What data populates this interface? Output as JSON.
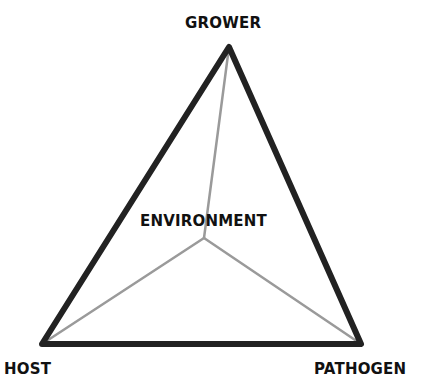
{
  "diagram": {
    "vertices": {
      "top": {
        "label": "GROWER",
        "x": 229,
        "y": 47
      },
      "left": {
        "label": "HOST",
        "x": 42,
        "y": 344
      },
      "right": {
        "label": "PATHOGEN",
        "x": 361,
        "y": 344
      },
      "center": {
        "label": "ENVIRONMENT",
        "x": 204,
        "y": 238
      }
    },
    "colors": {
      "outline": "#222222",
      "inner_lines": "#9a9a9a",
      "text": "#111111",
      "background": "#ffffff"
    }
  }
}
